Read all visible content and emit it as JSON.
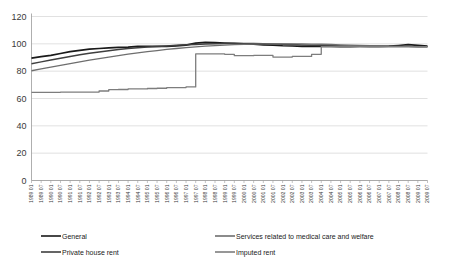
{
  "chart_data": {
    "type": "line",
    "title": "",
    "xlabel": "",
    "ylabel": "",
    "ylim": [
      0,
      120
    ],
    "ytick_step": 20,
    "yticks": [
      "0",
      "20",
      "40",
      "60",
      "80",
      "100",
      "120"
    ],
    "grid": true,
    "legend_position": "bottom",
    "note": "Index series, semiannual observations from 1989 01 to 2009 07; values read off the 0-120 index axis.",
    "categories": [
      "1989 01",
      "1989 07",
      "1990 01",
      "1990 07",
      "1991 01",
      "1991 07",
      "1992 01",
      "1992 07",
      "1993 01",
      "1993 07",
      "1994 01",
      "1994 07",
      "1995 01",
      "1995 07",
      "1996 01",
      "1996 07",
      "1997 01",
      "1997 07",
      "1998 01",
      "1998 07",
      "1999 01",
      "1999 07",
      "2000 01",
      "2000 07",
      "2001 01",
      "2001 07",
      "2002 01",
      "2002 07",
      "2003 01",
      "2003 07",
      "2004 01",
      "2004 07",
      "2005 01",
      "2005 07",
      "2006 01",
      "2006 07",
      "2007 01",
      "2007 07",
      "2008 01",
      "2008 07",
      "2009 01",
      "2009 07"
    ],
    "series": [
      {
        "name": "General",
        "color": "#1a1a1a",
        "width": 1.7,
        "values": [
          89.5,
          90.6,
          91.5,
          92.9,
          94.3,
          95.2,
          96.1,
          96.6,
          97.0,
          97.4,
          97.6,
          98.1,
          98.2,
          98.1,
          98.2,
          98.5,
          99.0,
          100.5,
          101.0,
          100.9,
          100.6,
          100.3,
          100.0,
          99.7,
          99.3,
          99.0,
          98.6,
          98.4,
          98.2,
          98.1,
          98.1,
          98.1,
          97.9,
          97.9,
          98.1,
          98.1,
          98.2,
          98.3,
          98.8,
          99.4,
          98.9,
          98.3
        ]
      },
      {
        "name": "Private house rent",
        "color": "#3f3f3f",
        "width": 1.5,
        "values": [
          85.5,
          86.8,
          88.1,
          89.5,
          90.8,
          92.0,
          93.1,
          94.1,
          95.0,
          95.8,
          96.5,
          97.1,
          97.6,
          98.1,
          98.5,
          98.9,
          99.3,
          99.6,
          99.9,
          100.1,
          100.2,
          100.3,
          100.3,
          100.2,
          100.1,
          99.9,
          99.7,
          99.5,
          99.2,
          99.0,
          98.8,
          98.6,
          98.4,
          98.3,
          98.2,
          98.1,
          98.1,
          98.0,
          98.0,
          98.0,
          97.9,
          97.9
        ]
      },
      {
        "name": "Services related to medical care and welfare",
        "color": "#6e6e6e",
        "width": 1.3,
        "values": [
          80.3,
          81.6,
          82.9,
          84.2,
          85.5,
          86.8,
          88.0,
          89.2,
          90.3,
          91.4,
          92.4,
          93.4,
          94.3,
          95.1,
          95.9,
          96.6,
          97.2,
          97.8,
          98.3,
          98.7,
          99.1,
          99.4,
          99.6,
          99.8,
          99.9,
          100.0,
          100.0,
          100.0,
          99.9,
          99.8,
          99.7,
          99.5,
          99.3,
          99.1,
          98.9,
          98.7,
          98.5,
          98.3,
          98.2,
          98.1,
          98.0,
          97.9
        ]
      },
      {
        "name": "Imputed rent",
        "color": "#7d7d7d",
        "width": 1.3,
        "step": true,
        "values": [
          64.5,
          64.5,
          64.5,
          64.6,
          64.6,
          64.7,
          64.7,
          65.5,
          66.5,
          66.6,
          67.0,
          67.0,
          67.3,
          67.5,
          68.0,
          68.0,
          68.5,
          92.6,
          92.6,
          92.6,
          92.3,
          91.3,
          91.3,
          91.5,
          91.5,
          90.3,
          90.3,
          90.8,
          90.8,
          92.3,
          97.9,
          97.9,
          97.9,
          97.9,
          97.9,
          97.9,
          97.9,
          97.9,
          97.9,
          97.9,
          97.9,
          97.9
        ]
      }
    ],
    "legend": [
      {
        "label": "General",
        "color": "#1a1a1a"
      },
      {
        "label": "Services related to medical care and welfare",
        "color": "#6e6e6e"
      },
      {
        "label": "Private house rent",
        "color": "#3f3f3f"
      },
      {
        "label": "Imputed rent",
        "color": "#7d7d7d"
      }
    ]
  }
}
